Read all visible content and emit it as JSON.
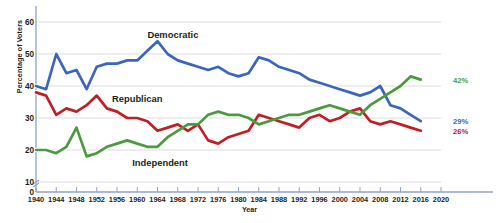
{
  "chart_data": {
    "type": "line",
    "title": "",
    "xlabel": "Year",
    "ylabel": "Percentage of Voters",
    "xlim": [
      1940,
      2020
    ],
    "ylim": [
      10,
      60
    ],
    "y_axis_break": true,
    "yticks": [
      0,
      10,
      20,
      30,
      40,
      50,
      60
    ],
    "xticks": [
      1940,
      1944,
      1948,
      1952,
      1956,
      1960,
      1964,
      1968,
      1972,
      1976,
      1980,
      1984,
      1988,
      1992,
      1996,
      2000,
      2004,
      2008,
      2012,
      2016,
      2020
    ],
    "grid": "horizontal",
    "legend_position": "inline-annotations",
    "colors": {
      "democratic": "#3a66bd",
      "republican": "#bf2026",
      "independent": "#4c9a3f",
      "gridline": "#dcdcdc",
      "axis": "#8fa4c8",
      "text": "#231f20"
    },
    "annotations": [
      {
        "name": "democratic-label",
        "text": "Democratic",
        "x": 1962,
        "y": 56
      },
      {
        "name": "republican-label",
        "text": "Republican",
        "x": 1955,
        "y": 36
      },
      {
        "name": "independent-label",
        "text": "Independent",
        "x": 1959,
        "y": 16
      }
    ],
    "end_labels": [
      {
        "name": "independent-end-label",
        "text": "42%",
        "series": "Independent",
        "value": 42,
        "color": "#4c9a3f"
      },
      {
        "name": "democratic-end-label",
        "text": "29%",
        "series": "Democratic",
        "value": 29,
        "color": "#3a66bd"
      },
      {
        "name": "republican-end-label",
        "text": "26%",
        "series": "Republican",
        "value": 26,
        "color": "#bf2026"
      }
    ],
    "series": [
      {
        "name": "Democratic",
        "color": "#3a66bd",
        "x": [
          1940,
          1942,
          1944,
          1946,
          1948,
          1950,
          1952,
          1954,
          1956,
          1958,
          1960,
          1962,
          1964,
          1966,
          1968,
          1970,
          1972,
          1974,
          1976,
          1978,
          1980,
          1982,
          1984,
          1986,
          1988,
          1990,
          1992,
          1994,
          1996,
          1998,
          2000,
          2002,
          2004,
          2006,
          2008,
          2010,
          2012,
          2014,
          2016
        ],
        "values": [
          40,
          39,
          50,
          44,
          45,
          39,
          46,
          47,
          47,
          48,
          48,
          51,
          54,
          50,
          48,
          47,
          46,
          45,
          46,
          44,
          43,
          44,
          49,
          48,
          46,
          45,
          44,
          42,
          41,
          40,
          39,
          38,
          37,
          38,
          40,
          34,
          33,
          31,
          29
        ]
      },
      {
        "name": "Republican",
        "color": "#bf2026",
        "x": [
          1940,
          1942,
          1944,
          1946,
          1948,
          1950,
          1952,
          1954,
          1956,
          1958,
          1960,
          1962,
          1964,
          1966,
          1968,
          1970,
          1972,
          1974,
          1976,
          1978,
          1980,
          1982,
          1984,
          1986,
          1988,
          1990,
          1992,
          1994,
          1996,
          1998,
          2000,
          2002,
          2004,
          2006,
          2008,
          2010,
          2012,
          2014,
          2016
        ],
        "values": [
          38,
          37,
          31,
          33,
          32,
          34,
          37,
          33,
          32,
          30,
          30,
          29,
          26,
          27,
          28,
          26,
          28,
          23,
          22,
          24,
          25,
          26,
          31,
          30,
          29,
          28,
          27,
          30,
          31,
          29,
          30,
          32,
          33,
          29,
          28,
          29,
          28,
          27,
          26
        ]
      },
      {
        "name": "Independent",
        "color": "#4c9a3f",
        "x": [
          1940,
          1942,
          1944,
          1946,
          1948,
          1950,
          1952,
          1954,
          1956,
          1958,
          1960,
          1962,
          1964,
          1966,
          1968,
          1970,
          1972,
          1974,
          1976,
          1978,
          1980,
          1982,
          1984,
          1986,
          1988,
          1990,
          1992,
          1994,
          1996,
          1998,
          2000,
          2002,
          2004,
          2006,
          2008,
          2010,
          2012,
          2014,
          2016
        ],
        "values": [
          20,
          20,
          19,
          21,
          27,
          18,
          19,
          21,
          22,
          23,
          22,
          21,
          21,
          24,
          26,
          28,
          28,
          31,
          32,
          31,
          31,
          30,
          28,
          29,
          30,
          31,
          31,
          32,
          33,
          34,
          33,
          32,
          31,
          34,
          36,
          38,
          40,
          43,
          42
        ]
      }
    ]
  }
}
